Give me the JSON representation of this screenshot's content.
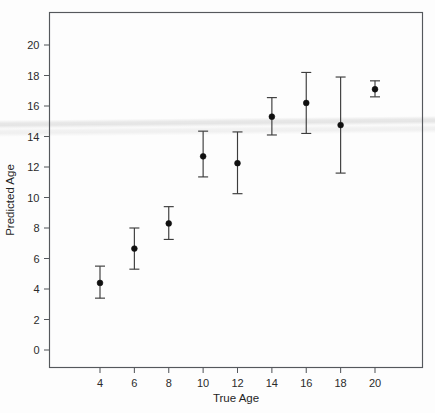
{
  "chart_data": {
    "type": "scatter",
    "title": "",
    "xlabel": "True Age",
    "ylabel": "Predicted Age",
    "xlim": [
      2.4,
      21.6
    ],
    "ylim": [
      -1.2,
      21.8
    ],
    "grid": false,
    "legend": null,
    "error_bars": "vertical",
    "x": [
      4,
      6,
      8,
      10,
      12,
      14,
      16,
      18,
      20
    ],
    "values": [
      4.4,
      6.65,
      8.3,
      12.7,
      12.25,
      15.3,
      16.2,
      14.75,
      17.1
    ],
    "y_lower": [
      3.4,
      5.3,
      7.25,
      11.35,
      10.25,
      14.1,
      14.2,
      11.6,
      16.6
    ],
    "y_upper": [
      5.5,
      8.0,
      9.4,
      14.35,
      14.3,
      16.55,
      18.2,
      17.9,
      17.65
    ],
    "xticks": [
      "4",
      "6",
      "8",
      "10",
      "12",
      "14",
      "16",
      "18",
      "20"
    ],
    "xtick_values": [
      4,
      6,
      8,
      10,
      12,
      14,
      16,
      18,
      20
    ],
    "yticks": [
      "0",
      "2",
      "4",
      "6",
      "8",
      "10",
      "12",
      "14",
      "16",
      "18",
      "20"
    ],
    "ytick_values": [
      0,
      2,
      4,
      6,
      8,
      10,
      12,
      14,
      16,
      18,
      20
    ],
    "marker": "filled-circle",
    "marker_color": "#101010",
    "errorbar_color": "#3c3c3c",
    "frame_color": "#55585c",
    "background_color": "#ffffff"
  },
  "axes": {
    "x_title": "True Age",
    "y_title": "Predicted Age"
  }
}
